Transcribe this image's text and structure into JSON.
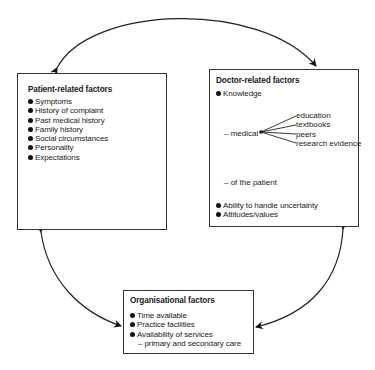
{
  "patient_box": {
    "title": "Patient-related factors",
    "items": [
      "Symptoms",
      "History of complaint",
      "Past medical history",
      "Family history",
      "Social circumstances",
      "Personality",
      "Expectations"
    ]
  },
  "doctor_box": {
    "title": "Doctor-related factors",
    "knowledge": "Knowledge",
    "medical_label": "– medical",
    "medical_sources": [
      "education",
      "textbooks",
      "peers",
      "research evidence"
    ],
    "of_patient": "– of the patient",
    "items": [
      "Ability to handle uncertainty",
      "Attitudes/values"
    ]
  },
  "org_box": {
    "title": "Organisational factors",
    "items": [
      "Time available",
      "Practice facilities",
      "Availability of services"
    ],
    "sub_item": "– primary and secondary care"
  },
  "arrows": [
    {
      "from": "patient-related factors",
      "to": "doctor-related factors",
      "type": "bidirectional"
    },
    {
      "from": "patient-related factors",
      "to": "organisational factors",
      "type": "bidirectional"
    },
    {
      "from": "doctor-related factors",
      "to": "organisational factors",
      "type": "bidirectional"
    }
  ]
}
